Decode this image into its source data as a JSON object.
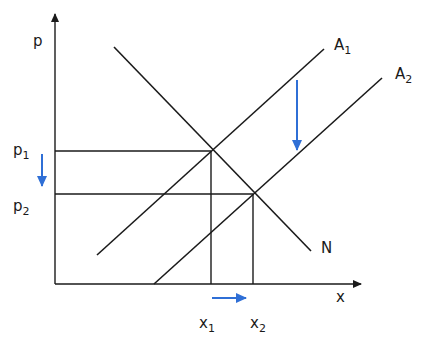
{
  "diagram": {
    "type": "supply-demand",
    "axes": {
      "y_label": "p",
      "x_label": "x"
    },
    "curves": {
      "demand": {
        "label": "N"
      },
      "supply_1": {
        "label": "A",
        "subscript": "1"
      },
      "supply_2": {
        "label": "A",
        "subscript": "2"
      }
    },
    "prices": [
      {
        "label": "p",
        "subscript": "1"
      },
      {
        "label": "p",
        "subscript": "2"
      }
    ],
    "quantities": [
      {
        "label": "x",
        "subscript": "1"
      },
      {
        "label": "x",
        "subscript": "2"
      }
    ],
    "arrow_color": "#2f6fd6",
    "line_color": "#1a1a1a"
  }
}
